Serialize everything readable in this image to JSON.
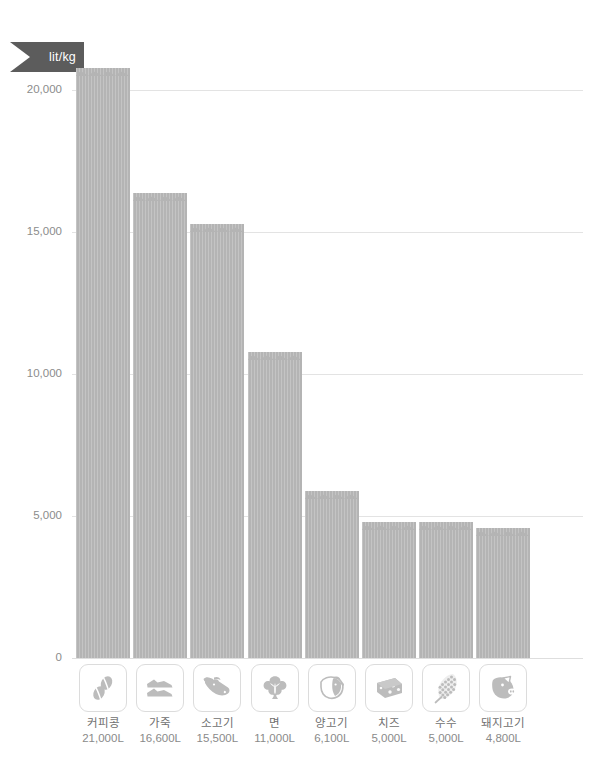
{
  "unit_badge": {
    "label": "lit/kg",
    "color": "#5c5c5c"
  },
  "axis": {
    "ticks": [
      "20,000",
      "15,000",
      "10,000",
      "5,000",
      "0"
    ]
  },
  "colors": {
    "bar": "#b4b4b4",
    "gridline": "#e3e3e3",
    "badge": "#5c5c5c",
    "text": "#7a7a7a"
  },
  "chart_data": {
    "type": "bar",
    "title": "",
    "subtitle": "",
    "xlabel": "",
    "ylabel": "lit/kg",
    "ylim": [
      0,
      21500
    ],
    "yticks": [
      0,
      5000,
      10000,
      15000,
      20000
    ],
    "ytick_labels": [
      "0",
      "5,000",
      "10,000",
      "15,000",
      "20,000"
    ],
    "grid": true,
    "legend": "none",
    "categories": [
      "커피콩",
      "가죽",
      "소고기",
      "면",
      "양고기",
      "치즈",
      "수수",
      "돼지고기"
    ],
    "values": [
      21000,
      16600,
      15500,
      11000,
      6100,
      5000,
      5000,
      4800
    ],
    "value_labels": [
      "21,000L",
      "16,600L",
      "15,500L",
      "11,000L",
      "6,100L",
      "5,000L",
      "5,000L",
      "4,800L"
    ],
    "icons": [
      "coffee-bean-icon",
      "leather-shoe-icon",
      "cow-head-icon",
      "cotton-boll-icon",
      "sheep-head-icon",
      "cheese-wedge-icon",
      "sorghum-grain-icon",
      "pig-head-icon"
    ]
  }
}
